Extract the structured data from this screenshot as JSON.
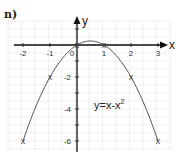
{
  "part_label": "n)",
  "chart_data": {
    "type": "line",
    "title": "",
    "equation": "y=x-x",
    "equation_exponent": "2",
    "xlabel": "x",
    "ylabel": "y",
    "xlim": [
      -2.2,
      3.4
    ],
    "ylim": [
      -6.6,
      1.6
    ],
    "grid": true,
    "x_ticks": [
      "-2",
      "-1",
      "0",
      "1",
      "2",
      "3"
    ],
    "y_ticks": [
      "-2",
      "-4",
      "-6"
    ],
    "x": [
      -2,
      -1,
      0,
      1,
      2,
      3
    ],
    "values": [
      -6,
      -2,
      0,
      0,
      -2,
      -6
    ],
    "point_marker": "x",
    "curve": "y = x - x^2"
  },
  "colors": {
    "axis": "#111111",
    "curve": "#555555",
    "grid": "#e4e4e4"
  }
}
